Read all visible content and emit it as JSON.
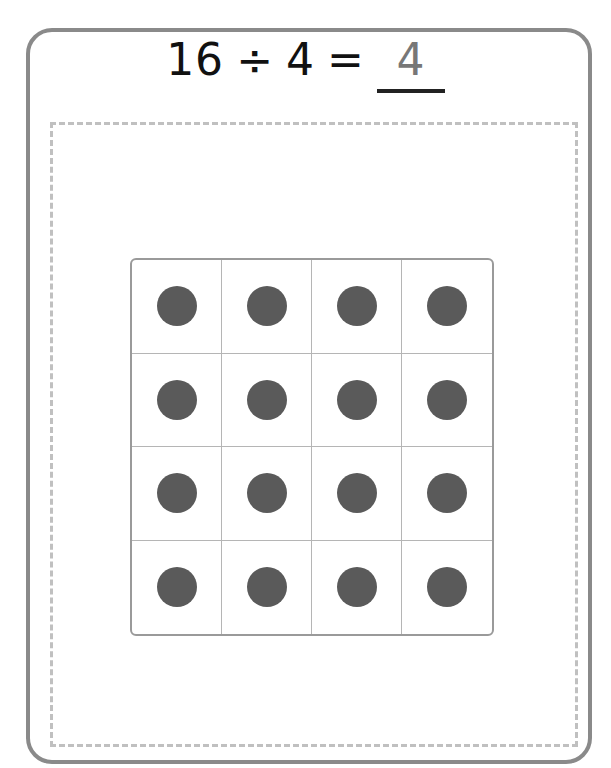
{
  "equation": {
    "dividend": "16",
    "operator": "÷",
    "divisor": "4",
    "equals": "=",
    "answer": "4"
  },
  "array": {
    "rows": 4,
    "columns": 4,
    "dot_color": "#5a5a5a"
  }
}
